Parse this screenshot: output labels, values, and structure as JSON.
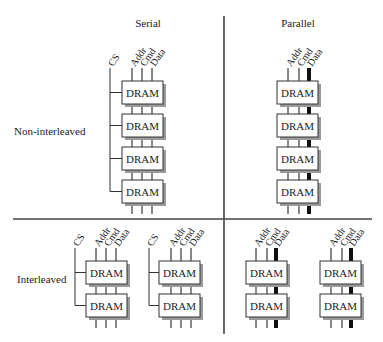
{
  "columns": {
    "serial": "Serial",
    "parallel": "Parallel"
  },
  "rows": {
    "non_interleaved": "Non-interleaved",
    "interleaved": "Interleaved"
  },
  "signals": {
    "cs": "CS",
    "addr": "Addr",
    "cmd": "Cmd",
    "data": "Data"
  },
  "chip_label": "DRAM",
  "colors": {
    "line": "#333333",
    "box_fill": "#ffffff",
    "box_shadow": "#9a9a9a",
    "divider": "#444444"
  },
  "quadrants": [
    {
      "name": "serial-non-interleaved",
      "groups": 1,
      "chips_per_group": 4,
      "has_cs": true,
      "thick_data": false
    },
    {
      "name": "parallel-non-interleaved",
      "groups": 1,
      "chips_per_group": 4,
      "has_cs": false,
      "thick_data": true
    },
    {
      "name": "serial-interleaved",
      "groups": 2,
      "chips_per_group": 2,
      "has_cs": true,
      "thick_data": false
    },
    {
      "name": "parallel-interleaved",
      "groups": 2,
      "chips_per_group": 2,
      "has_cs": false,
      "thick_data": true
    }
  ]
}
